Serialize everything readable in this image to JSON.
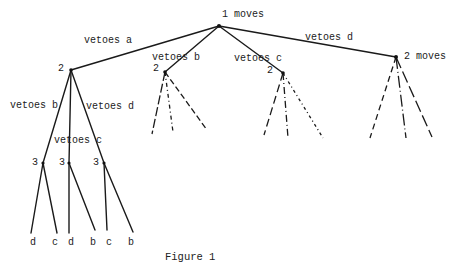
{
  "figure": {
    "caption": "Figure 1",
    "root": {
      "label": "1 moves"
    },
    "branches": [
      {
        "edge_label": "vetoes a",
        "node_label": "2"
      },
      {
        "edge_label": "vetoes b",
        "node_label": "2"
      },
      {
        "edge_label": "vetoes c",
        "node_label": "2"
      },
      {
        "edge_label": "vetoes d",
        "node_label": "2 moves"
      }
    ],
    "sub_branches_of_a": [
      {
        "edge_label": "vetoes b",
        "node_label": "3",
        "leaves": [
          "d",
          "c"
        ]
      },
      {
        "edge_label": "vetoes c",
        "node_label": "3",
        "leaves": [
          "d",
          "b"
        ]
      },
      {
        "edge_label": "vetoes d",
        "node_label": "3",
        "leaves": [
          "c",
          "b"
        ]
      }
    ]
  }
}
